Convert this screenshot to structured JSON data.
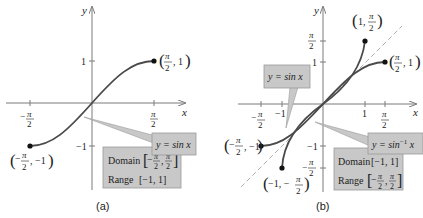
{
  "colors": {
    "axis": "#7a7a7a",
    "curve": "#4a4a4a",
    "dashed": "#b0b0b0",
    "box_fill": "#c8c8c8",
    "box_stroke": "#9a9a9a",
    "text": "#222222",
    "dot": "#111111"
  },
  "panel_a": {
    "caption": "(a)",
    "x_axis_label": "x",
    "y_axis_label": "y",
    "x_ticks": [
      {
        "num": "π",
        "den": "2",
        "neg": true
      },
      {
        "num": "π",
        "den": "2",
        "neg": false
      }
    ],
    "y_ticks": [
      "1",
      "−1"
    ],
    "points": [
      {
        "label_pre": "(",
        "num": "π",
        "den": "2",
        "neg": false,
        "label_post": ", 1)"
      },
      {
        "label_pre": "(",
        "num": "π",
        "den": "2",
        "neg": true,
        "label_post": ", −1)"
      }
    ],
    "function_label": "y = sin x",
    "info_box": {
      "domain_label": "Domain",
      "domain_value": "[−π/2, π/2]",
      "range_label": "Range",
      "range_value": "[−1, 1]"
    }
  },
  "panel_b": {
    "caption": "(b)",
    "x_axis_label": "x",
    "y_axis_label": "y",
    "x_ticks": [
      "−π/2",
      "−1",
      "1",
      "π/2"
    ],
    "y_ticks": [
      "π/2",
      "1",
      "−1",
      "−π/2"
    ],
    "points": [
      {
        "label": "(1, π/2)"
      },
      {
        "label": "(π/2, 1)"
      },
      {
        "label": "(−π/2, −1)"
      },
      {
        "label": "(−1, −π/2)"
      }
    ],
    "function_label_sin": "y = sin x",
    "function_label_arcsin_base": "y = sin",
    "function_label_arcsin_sup": "−1",
    "function_label_arcsin_var": " x",
    "info_box": {
      "domain_label": "Domain",
      "domain_value": "[−1, 1]",
      "range_label": "Range",
      "range_value": "[−π/2, π/2]"
    }
  }
}
